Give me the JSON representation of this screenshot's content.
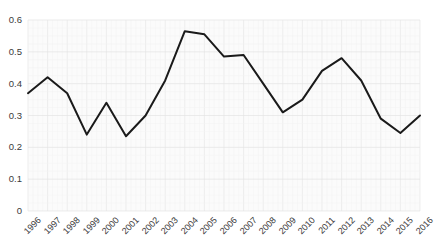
{
  "chart_data": {
    "type": "line",
    "title": "",
    "subtitle": "",
    "xlabel": "",
    "ylabel": "",
    "categories": [
      "1996",
      "1997",
      "1998",
      "1999",
      "2000",
      "2001",
      "2002",
      "2003",
      "2004",
      "2005",
      "2006",
      "2007",
      "2008",
      "2009",
      "2010",
      "2011",
      "2012",
      "2013",
      "2014",
      "2015",
      "2016"
    ],
    "values": [
      0.37,
      0.42,
      0.37,
      0.24,
      0.34,
      0.235,
      0.3,
      0.41,
      0.565,
      0.555,
      0.485,
      0.49,
      0.4,
      0.31,
      0.35,
      0.44,
      0.48,
      0.41,
      0.29,
      0.245,
      0.3
    ],
    "series": [
      {
        "name": "series-1",
        "values": [
          0.37,
          0.42,
          0.37,
          0.24,
          0.34,
          0.235,
          0.3,
          0.41,
          0.565,
          0.555,
          0.485,
          0.49,
          0.4,
          0.31,
          0.35,
          0.44,
          0.48,
          0.41,
          0.29,
          0.245,
          0.3
        ]
      }
    ],
    "ylim": [
      0,
      0.6
    ],
    "yticks": [
      0,
      0.1,
      0.2,
      0.3,
      0.4,
      0.5,
      0.6
    ],
    "ytick_labels": [
      "0",
      "0.1",
      "0.2",
      "0.3",
      "0.4",
      "0.5",
      "0.6"
    ],
    "xtick_labels": [
      "1996",
      "1997",
      "1998",
      "1999",
      "2000",
      "2001",
      "2002",
      "2003",
      "2004",
      "2005",
      "2006",
      "2007",
      "2008",
      "2009",
      "2010",
      "2011",
      "2012",
      "2013",
      "2014",
      "2015",
      "2016"
    ],
    "grid": true,
    "grid_color": "#ededed",
    "legend": false,
    "legend_position": "none",
    "line_color": "#1a1a1a",
    "line_width": 2,
    "background_color": "#fbfbfb",
    "axis_text_color": "#3a3a3a",
    "annotations": []
  }
}
